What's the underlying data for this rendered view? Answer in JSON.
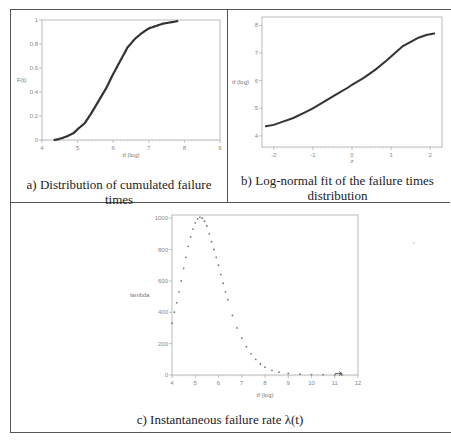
{
  "figure": {
    "panels": [
      {
        "id": "a",
        "caption": "a) Distribution of cumulated failure times",
        "xlabel": "tf (log)",
        "ylabel": "F(t)",
        "xticks": [
          "4",
          "5",
          "6",
          "7",
          "8",
          "9"
        ],
        "yticks": [
          "0",
          "0.2",
          "0.4",
          "0.6",
          "0.8",
          "1"
        ]
      },
      {
        "id": "b",
        "caption_line1": "b) Log-normal fit of the failure times",
        "caption_line2": "distribution",
        "xlabel": "z",
        "ylabel": "tf (log)",
        "xticks": [
          "-2",
          "-1",
          "0",
          "1",
          "2"
        ],
        "yticks": [
          "4",
          "5",
          "6",
          "7",
          "8"
        ]
      },
      {
        "id": "c",
        "caption": "c) Instantaneous failure rate λ(t)",
        "xlabel": "tf (log)",
        "ylabel": "lambda",
        "xticks": [
          "4",
          "5",
          "6",
          "7",
          "8",
          "9",
          "10",
          "11",
          "12"
        ],
        "yticks": [
          "0",
          "200",
          "400",
          "600",
          "800",
          "1000"
        ]
      }
    ]
  },
  "chart_data": [
    {
      "type": "line",
      "title": "a) Distribution of cumulated failure times",
      "xlabel": "tf (log)",
      "ylabel": "F(t)",
      "xlim": [
        4,
        9
      ],
      "ylim": [
        0,
        1
      ],
      "grid": false,
      "series": [
        {
          "name": "empirical CDF",
          "x": [
            4.35,
            4.5,
            4.7,
            4.9,
            5.0,
            5.2,
            5.4,
            5.6,
            5.8,
            6.0,
            6.2,
            6.4,
            6.6,
            6.8,
            7.0,
            7.2,
            7.4,
            7.6,
            7.8
          ],
          "y": [
            0.0,
            0.01,
            0.03,
            0.06,
            0.09,
            0.14,
            0.23,
            0.33,
            0.43,
            0.55,
            0.66,
            0.77,
            0.84,
            0.89,
            0.93,
            0.95,
            0.97,
            0.98,
            0.99
          ]
        }
      ]
    },
    {
      "type": "scatter",
      "title": "b) Log-normal fit of the failure times distribution",
      "xlabel": "z",
      "ylabel": "tf (log)",
      "xlim": [
        -2.3,
        2.3
      ],
      "ylim": [
        3.6,
        8.3
      ],
      "grid": false,
      "series": [
        {
          "name": "normal probability plot",
          "x": [
            -2.2,
            -2.0,
            -1.8,
            -1.5,
            -1.2,
            -1.0,
            -0.7,
            -0.4,
            -0.1,
            0.0,
            0.3,
            0.6,
            0.9,
            1.1,
            1.3,
            1.5,
            1.7,
            1.9,
            2.1
          ],
          "y": [
            4.35,
            4.4,
            4.5,
            4.65,
            4.85,
            5.0,
            5.25,
            5.5,
            5.75,
            5.85,
            6.1,
            6.4,
            6.75,
            7.0,
            7.25,
            7.4,
            7.55,
            7.65,
            7.7
          ]
        }
      ]
    },
    {
      "type": "scatter",
      "title": "c) Instantaneous failure rate λ(t)",
      "xlabel": "tf (log)",
      "ylabel": "lambda",
      "xlim": [
        4,
        12
      ],
      "ylim": [
        0,
        1020
      ],
      "grid": false,
      "series": [
        {
          "name": "lambda(t)",
          "x": [
            4.0,
            4.1,
            4.2,
            4.3,
            4.4,
            4.5,
            4.6,
            4.7,
            4.8,
            4.9,
            5.0,
            5.1,
            5.2,
            5.3,
            5.4,
            5.5,
            5.6,
            5.7,
            5.8,
            5.9,
            6.0,
            6.1,
            6.2,
            6.3,
            6.4,
            6.6,
            6.8,
            7.0,
            7.2,
            7.4,
            7.6,
            7.8,
            8.0,
            8.3,
            8.6,
            9.0,
            9.5,
            10.0,
            10.5,
            11.0,
            11.3
          ],
          "y": [
            330,
            400,
            460,
            530,
            600,
            680,
            750,
            820,
            880,
            930,
            970,
            995,
            1005,
            1000,
            980,
            950,
            900,
            850,
            800,
            750,
            700,
            640,
            585,
            530,
            480,
            380,
            300,
            235,
            180,
            135,
            100,
            70,
            50,
            30,
            18,
            10,
            5,
            3,
            2,
            1,
            0
          ]
        }
      ]
    }
  ]
}
